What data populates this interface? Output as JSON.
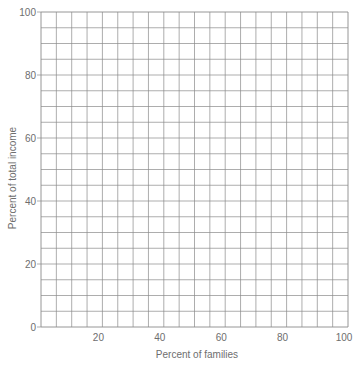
{
  "chart_data": {
    "type": "line",
    "title": "",
    "xlabel": "Percent of families",
    "ylabel": "Percent of total income",
    "xlim": [
      0,
      100
    ],
    "ylim": [
      0,
      100
    ],
    "x_ticks": [
      20,
      40,
      60,
      80,
      100
    ],
    "y_ticks": [
      0,
      20,
      40,
      60,
      80,
      100
    ],
    "grid": true,
    "grid_step": 5,
    "grid_color": "#8a8a8a",
    "legend": null,
    "series": []
  },
  "labels": {
    "x_axis": "Percent of families",
    "y_axis": "Percent of total income",
    "x_ticks": [
      "20",
      "40",
      "60",
      "80",
      "100"
    ],
    "y_ticks": [
      "0",
      "20",
      "40",
      "60",
      "80",
      "100"
    ]
  }
}
